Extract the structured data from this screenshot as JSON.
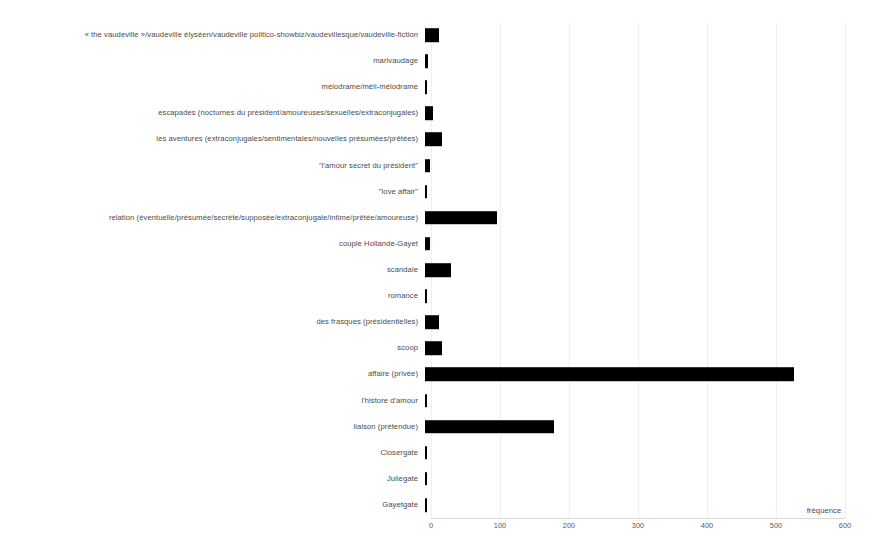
{
  "chart_data": {
    "type": "bar",
    "orientation": "horizontal",
    "title": "",
    "subtitle": "",
    "xlabel": "fréquence",
    "ylabel": "",
    "xlim": [
      0,
      600
    ],
    "xticks": [
      0,
      100,
      200,
      300,
      400,
      500,
      600
    ],
    "xtick_labels": [
      "0",
      "100",
      "200",
      "300",
      "400",
      "500",
      "600"
    ],
    "grid": true,
    "grid_axis": "x",
    "legend": null,
    "bar_color": "#000000",
    "categories": [
      "« the vaudeville »/vaudeville élyséen/vaudeville politico-showbiz/vaudevillesque/vaudeville-fiction",
      "marivaudage",
      "mélodrame/méli-mélodrame",
      "escapades (nocturnes du président/amoureuses/sexuelles/extraconjugales)",
      "les aventures (extraconjugales/sentimentales/nouvelles présumées/prêtées)",
      "\"l'amour secret du président\"",
      "\"love affair\"",
      "relation (éventuelle/présumée/secrète/supposée/extraconjugale/intime/prêtée/amoureuse)",
      "couple Hollande-Gayet",
      "scandale",
      "romance",
      "des frasques (présidentielles)",
      "scoop",
      "affaire (privée)",
      "l'histore d'amour",
      "liaison (prétendue)",
      "Closergate",
      "Juliegate",
      "Gayetgate"
    ],
    "values": [
      20,
      4,
      3,
      12,
      25,
      7,
      3,
      104,
      7,
      38,
      3,
      21,
      24,
      535,
      3,
      187,
      2,
      2,
      3
    ]
  }
}
